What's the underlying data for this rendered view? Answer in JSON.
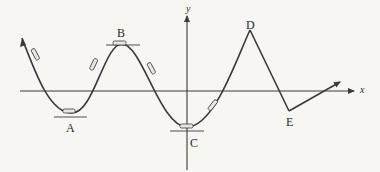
{
  "diagram": {
    "axes": {
      "x_label": "x",
      "y_label": "y"
    },
    "points": [
      {
        "id": "A",
        "label": "A",
        "kind": "valley"
      },
      {
        "id": "B",
        "label": "B",
        "kind": "crest"
      },
      {
        "id": "C",
        "label": "C",
        "kind": "valley-at-origin-axis"
      },
      {
        "id": "D",
        "label": "D",
        "kind": "sharp-peak"
      },
      {
        "id": "E",
        "label": "E",
        "kind": "sharp-valley"
      }
    ],
    "colors": {
      "curve": "#3a3a3a",
      "axis": "#3a3a3a",
      "background": "#f7f6f3"
    }
  }
}
